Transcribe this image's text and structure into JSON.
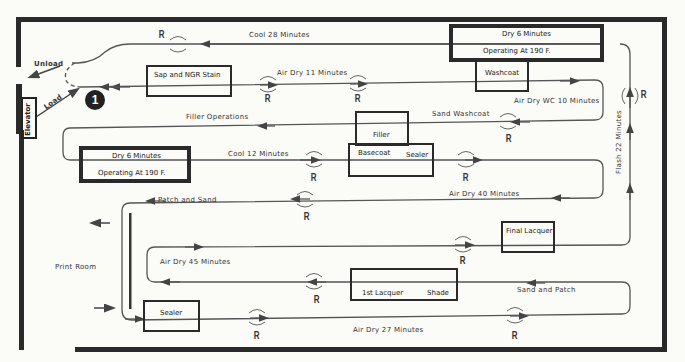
{
  "diagram": {
    "side_labels": {
      "unload": "Unload",
      "load": "Load",
      "elevator": "Elevator",
      "print_room": "Print Room",
      "station_number": "1"
    },
    "stations": {
      "oven_top_line1": "Dry 6 Minutes",
      "oven_top_line2": "Operating At 190  F.",
      "oven_left_line1": "Dry 6 Minutes",
      "oven_left_line2": "Operating At 190  F.",
      "sap_stain": "Sap and NGR Stain",
      "washcoat": "Washcoat",
      "filler": "Filler",
      "basecoat": "Basecoat",
      "sealer_top": "Sealer",
      "final_lacquer": "Final Lacquer",
      "first_lacquer": "1st Lacquer",
      "shade": "Shade",
      "sealer_bottom": "Sealer"
    },
    "segments": {
      "cool_28": "Cool 28 Minutes",
      "air_dry_11": "Air Dry 11 Minutes",
      "air_dry_wc_10": "Air Dry WC 10 Minutes",
      "sand_washcoat": "Sand Washcoat",
      "filler_operations": "Filler Operations",
      "cool_12": "Cool 12 Minutes",
      "air_dry_40": "Air Dry 40 Minutes",
      "patch_and_sand": "Patch and Sand",
      "flash_22": "Flash 22 Minutes",
      "air_dry_45": "Air Dry 45 Minutes",
      "sand_and_patch": "Sand and Patch",
      "air_dry_27": "Air Dry 27 Minutes"
    },
    "rotation_marker": "R"
  }
}
